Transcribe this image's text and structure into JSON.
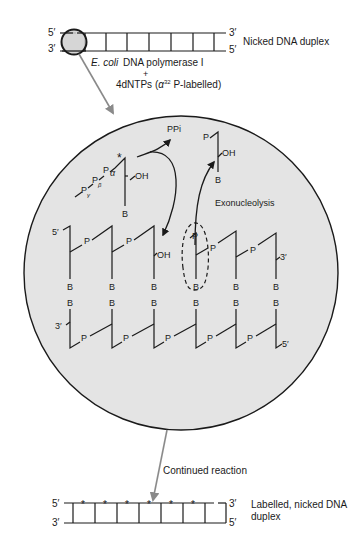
{
  "top_duplex": {
    "label": "Nicked DNA duplex",
    "left_top_end": "5′",
    "left_bottom_end": "3′",
    "right_top_end": "3′",
    "right_bottom_end": "5′"
  },
  "reagents": {
    "enzyme_italic": "E. coli",
    "enzyme_rest": "DNA polymerase I",
    "plus": "+",
    "dntps_prefix": "4dNTPs (",
    "alpha": "α",
    "isotope_sup": "32",
    "dntps_suffix": " P-labelled)"
  },
  "zoom_view": {
    "incoming_nucleotide": {
      "gamma_p": "P",
      "gamma": "γ",
      "beta_p": "P",
      "beta": "β",
      "alpha_p": "P",
      "alpha": "α",
      "label_star": "*",
      "oh": "OH",
      "base": "B"
    },
    "released_pyrophosphate": "PPi",
    "excised_nucleotide": {
      "p": "P",
      "oh": "OH",
      "base": "B"
    },
    "exonucleolysis_label": "Exonucleolysis",
    "upper_strand": {
      "five_prime": "5′",
      "three_prime": "3′",
      "phosphate": "P",
      "base": "B",
      "nick_oh": "OH"
    },
    "lower_strand": {
      "three_prime": "3′",
      "five_prime": "5′",
      "phosphate": "P",
      "base": "B"
    }
  },
  "continued_reaction_label": "Continued reaction",
  "bottom_duplex": {
    "label_line1": "Labelled, nicked DNA",
    "label_line2": "duplex",
    "left_top_end": "5′",
    "left_bottom_end": "3′",
    "right_top_end": "3′",
    "right_bottom_end": "5′",
    "label_star": "*"
  },
  "colors": {
    "line": "#1a1a1a",
    "circle_fill": "#e4e4e4",
    "arrow_gray": "#8a8a8a"
  }
}
